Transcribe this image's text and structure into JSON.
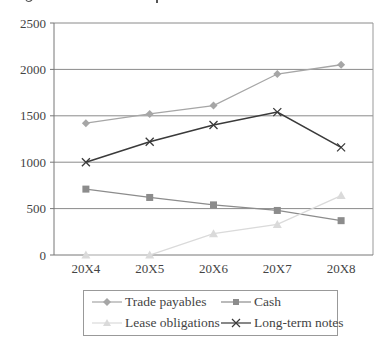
{
  "chart_data": {
    "type": "line",
    "title": "",
    "xlabel": "",
    "ylabel": "",
    "categories": [
      "20X4",
      "20X5",
      "20X6",
      "20X7",
      "20X8"
    ],
    "ylim": [
      0,
      2500
    ],
    "yticks": [
      0,
      500,
      1000,
      1500,
      2000,
      2500
    ],
    "grid": true,
    "legend_position": "bottom",
    "series": [
      {
        "name": "Trade payables",
        "marker": "diamond",
        "color": "#a6a6a6",
        "values": [
          1420,
          1520,
          1610,
          1950,
          2050
        ]
      },
      {
        "name": "Cash",
        "marker": "square",
        "color": "#8c8c8c",
        "values": [
          710,
          620,
          540,
          480,
          370
        ]
      },
      {
        "name": "Lease obligations",
        "marker": "triangle",
        "color": "#dadada",
        "values": [
          0,
          0,
          230,
          330,
          640
        ]
      },
      {
        "name": "Long-term notes",
        "marker": "x",
        "color": "#3a3a3a",
        "values": [
          1000,
          1220,
          1400,
          1540,
          1160
        ]
      }
    ]
  },
  "legend": {
    "items": [
      {
        "label": "Trade payables"
      },
      {
        "label": "Cash"
      },
      {
        "label": "Lease obligations"
      },
      {
        "label": "Long-term notes"
      }
    ]
  }
}
